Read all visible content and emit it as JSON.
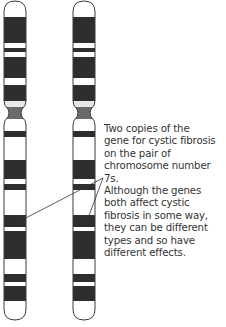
{
  "diagram": {
    "caption": "Two copies of the gene for cystic fibrosis on the pair of chromosome number 7s. Although the genes both affect cystic fibrosis in some way, they can be different types and so have different effects.",
    "caption_lines": [
      "Two copies of the",
      "gene for cystic fibrosis",
      "on the pair of",
      "chromosome number 7s.",
      "Although the genes",
      "both affect cystic",
      "fibrosis in some way,",
      "they can be different",
      "types and so have",
      "different effects."
    ],
    "chromosomes": [
      {
        "name": "chromosome-7-left",
        "x": 4
      },
      {
        "name": "chromosome-7-right",
        "x": 73
      }
    ],
    "colors": {
      "dark_band": "#2e2e2e",
      "light_band": "#ffffff",
      "centromere": "#6a6a6a",
      "outline": "#3a3a3a",
      "text": "#333333"
    }
  }
}
